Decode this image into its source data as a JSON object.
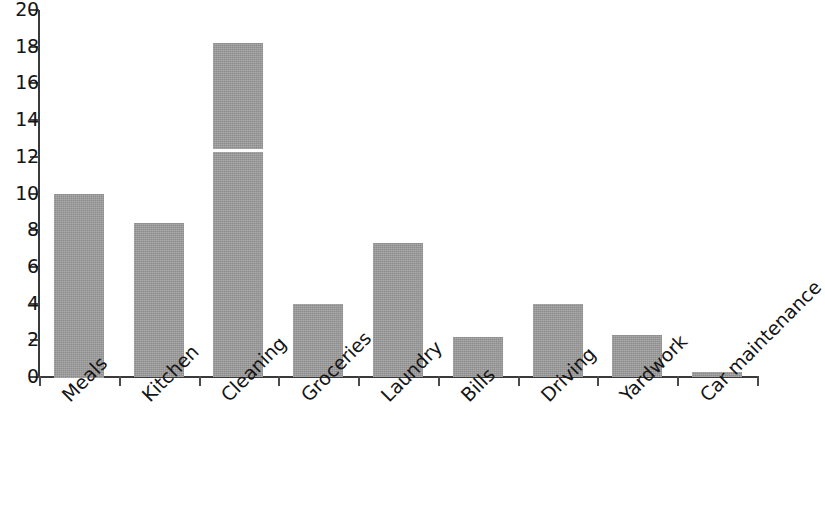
{
  "chart_data": {
    "type": "bar",
    "title": "",
    "subtitle": "",
    "xlabel": "",
    "ylabel": "",
    "categories": [
      "Meals",
      "Kitchen",
      "Cleaning",
      "Groceries",
      "Laundry",
      "Bills",
      "Driving",
      "Yardwork",
      "Car maintenance"
    ],
    "values": [
      10.0,
      8.4,
      18.2,
      4.0,
      7.3,
      2.2,
      4.0,
      2.3,
      0.25
    ],
    "segment_markers": [
      {
        "category": "Cleaning",
        "value": 12.4
      }
    ],
    "ylim": [
      0,
      20
    ],
    "ytick_labels": [
      "0",
      "2",
      "4",
      "6",
      "8",
      "10",
      "12",
      "14",
      "16",
      "18",
      "20"
    ],
    "ytick_values": [
      0,
      2,
      4,
      6,
      8,
      10,
      12,
      14,
      16,
      18,
      20
    ],
    "grid": false,
    "legend": null,
    "legend_position": "none",
    "bar_color": "#9b9b9b",
    "axis_color": "#3a3a3a",
    "background_color": "#ffffff",
    "label_rotation_deg": -45
  }
}
